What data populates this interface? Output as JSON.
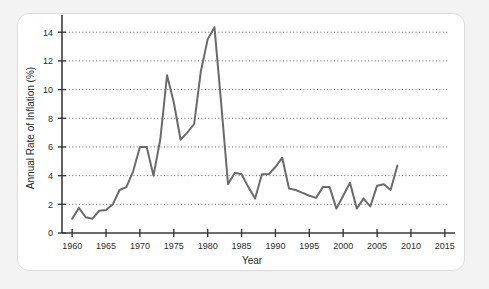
{
  "figure": {
    "background_color": "#f3f3f3",
    "card_color": "#ffffff",
    "card_border_color": "#dcdcdc"
  },
  "chart_data": {
    "type": "line",
    "title": "",
    "subtitle": "",
    "xlabel": "Year",
    "ylabel": "Annual Rate of Inflation (%)",
    "xlim": [
      1958.5,
      2016.5
    ],
    "ylim": [
      0,
      15.2
    ],
    "xticks": [
      1960,
      1965,
      1970,
      1975,
      1980,
      1985,
      1990,
      1995,
      2000,
      2005,
      2010,
      2015
    ],
    "xtick_labels": [
      "1960",
      "1965",
      "1970",
      "1975",
      "1980",
      "1985",
      "1990",
      "1995",
      "2000",
      "2005",
      "2010",
      "2015"
    ],
    "yticks": [
      0,
      2,
      4,
      6,
      8,
      10,
      12,
      14
    ],
    "ytick_labels": [
      "0",
      "2",
      "4",
      "6",
      "8",
      "10",
      "12",
      "14"
    ],
    "grid": true,
    "grid_axis": "y",
    "grid_style": "dotted",
    "grid_color": "#555555",
    "legend": false,
    "legend_position": "none",
    "line_color": "#6b6b6b",
    "line_width": 2.0,
    "axis_color": "#3a3a3a",
    "series": [
      {
        "name": "Annual Rate of Inflation",
        "x": [
          1960,
          1961,
          1962,
          1963,
          1964,
          1965,
          1966,
          1967,
          1968,
          1969,
          1970,
          1971,
          1972,
          1973,
          1974,
          1975,
          1976,
          1977,
          1978,
          1979,
          1980,
          1981,
          1982,
          1983,
          1984,
          1985,
          1986,
          1987,
          1988,
          1989,
          1990,
          1991,
          1992,
          1993,
          1994,
          1995,
          1996,
          1997,
          1998,
          1999,
          2000,
          2001,
          2002,
          2003,
          2004,
          2005,
          2006,
          2007,
          2008
        ],
        "values": [
          1.0,
          1.75,
          1.1,
          1.0,
          1.55,
          1.6,
          2.0,
          3.0,
          3.2,
          4.3,
          6.0,
          6.0,
          4.0,
          6.5,
          11.0,
          9.1,
          6.5,
          7.0,
          7.6,
          11.3,
          13.5,
          14.35,
          9.0,
          3.4,
          4.2,
          4.1,
          3.2,
          2.4,
          4.1,
          4.1,
          4.6,
          5.25,
          3.1,
          3.0,
          2.8,
          2.6,
          2.45,
          3.2,
          3.2,
          1.7,
          2.6,
          3.5,
          1.7,
          2.4,
          1.85,
          3.3,
          3.4,
          3.0,
          4.7
        ]
      }
    ]
  }
}
